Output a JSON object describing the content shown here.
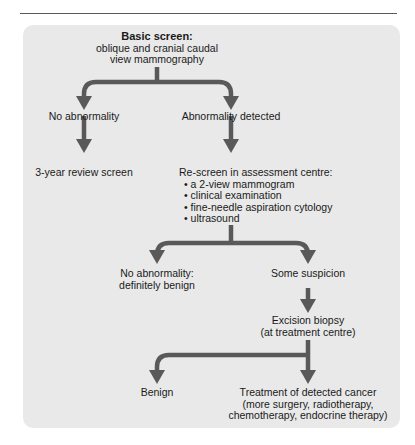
{
  "diagram": {
    "type": "flowchart",
    "colors": {
      "panel": "#e9e9e9",
      "arrow": "#595959",
      "text": "#1a1a1a",
      "rule": "#5a5a5a"
    },
    "nodes": {
      "basic_screen": {
        "title": "Basic screen:",
        "line1": "oblique and cranial caudal",
        "line2": "view mammography"
      },
      "no_abnormality": {
        "label": "No abnormality"
      },
      "abnormality_detected": {
        "label": "Abnormality detected"
      },
      "review_screen": {
        "label": "3-year review screen"
      },
      "rescreen": {
        "title": "Re-screen in assessment centre:",
        "items": [
          "a  2-view mammogram",
          "clinical examination",
          "fine-needle aspiration cytology",
          "ultrasound"
        ]
      },
      "definitely_benign": {
        "line1": "No abnormality:",
        "line2": "definitely benign"
      },
      "some_suspicion": {
        "label": "Some suspicion"
      },
      "excision_biopsy": {
        "line1": "Excision biopsy",
        "line2": "(at treatment centre)"
      },
      "benign": {
        "label": "Benign"
      },
      "treatment": {
        "line1": "Treatment of detected cancer",
        "line2": "(more surgery, radiotherapy,",
        "line3": "chemotherapy, endocrine therapy)"
      }
    },
    "edges": [
      [
        "basic_screen",
        "no_abnormality"
      ],
      [
        "basic_screen",
        "abnormality_detected"
      ],
      [
        "no_abnormality",
        "review_screen"
      ],
      [
        "abnormality_detected",
        "rescreen"
      ],
      [
        "rescreen",
        "definitely_benign"
      ],
      [
        "rescreen",
        "some_suspicion"
      ],
      [
        "some_suspicion",
        "excision_biopsy"
      ],
      [
        "excision_biopsy",
        "benign"
      ],
      [
        "excision_biopsy",
        "treatment"
      ]
    ]
  }
}
